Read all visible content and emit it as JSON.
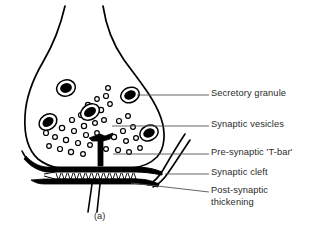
{
  "figure": {
    "caption": "(a)",
    "colors": {
      "ink": "#000000",
      "text": "#2b2b2b",
      "leader": "#555555",
      "background": "#ffffff",
      "granule_core": "#000000",
      "granule_ring": "#ffffff"
    }
  },
  "labels": [
    {
      "id": "secretory-granule",
      "text": "Secretory granule",
      "x": 211,
      "y": 88,
      "line2": ""
    },
    {
      "id": "synaptic-vesicles",
      "text": "Synaptic vesicles",
      "x": 211,
      "y": 119,
      "line2": ""
    },
    {
      "id": "pre-synaptic-t-bar",
      "text": "Pre-synaptic 'T-bar'",
      "x": 211,
      "y": 147,
      "line2": ""
    },
    {
      "id": "synaptic-cleft",
      "text": "Synaptic cleft",
      "x": 211,
      "y": 167,
      "line2": ""
    },
    {
      "id": "post-synaptic-thickening",
      "text": "Post-synaptic",
      "x": 211,
      "y": 185,
      "line2": "thickening"
    }
  ],
  "structures": {
    "bouton": "pre-synaptic axon terminal bulb",
    "granule_count": 5,
    "vesicle_count": 36,
    "t_bar": "pre-synaptic dense projection",
    "cleft": "hatched synaptic cleft",
    "post_synaptic_bar": "post-synaptic density",
    "dendrite": "post-synaptic process"
  }
}
